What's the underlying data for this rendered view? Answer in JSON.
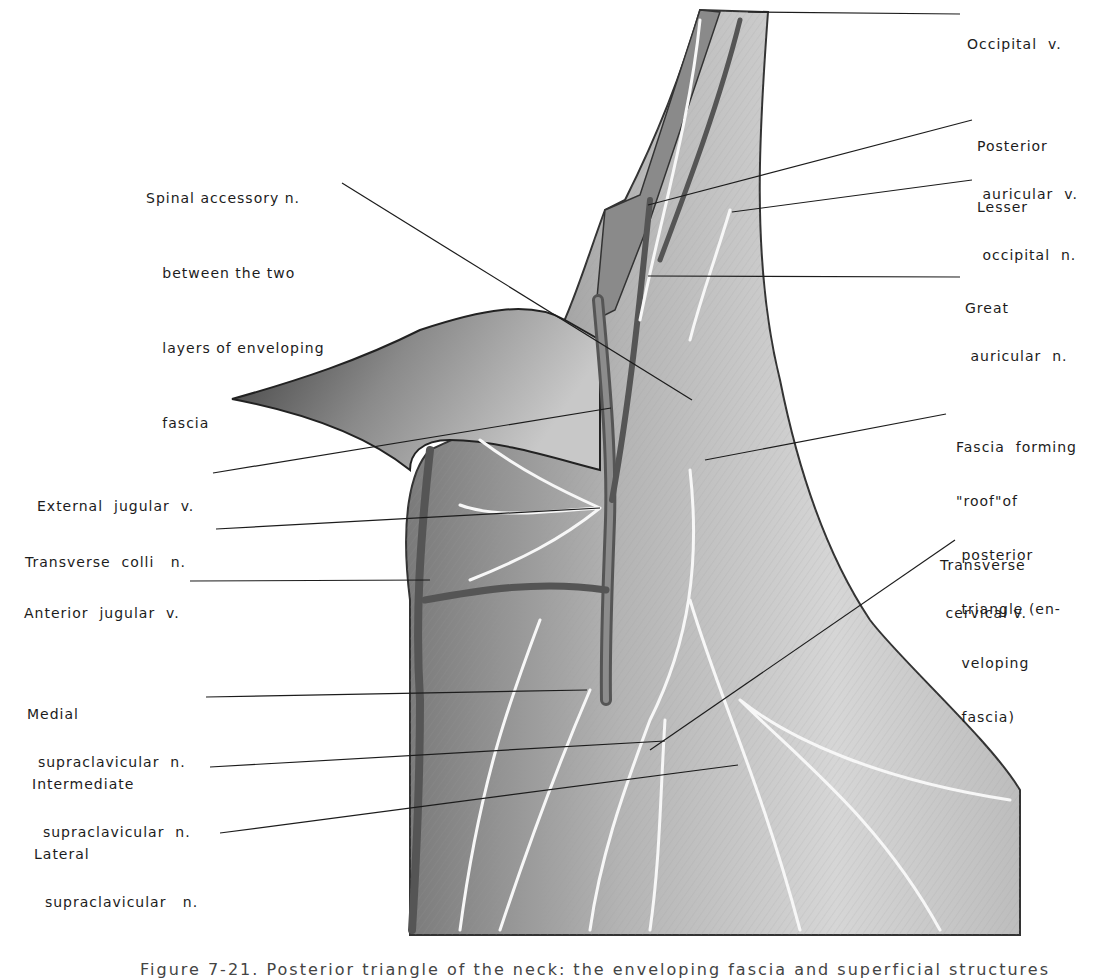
{
  "figure": {
    "caption": "Figure 7-21. Posterior triangle of the neck: the enveloping fascia and superficial structures",
    "labels": {
      "occipital_v": [
        "Occipital  v."
      ],
      "posterior_auricular_v": [
        "Posterior",
        " auricular  v."
      ],
      "lesser_occipital_n": [
        "Lesser",
        " occipital  n."
      ],
      "great_auricular_n": [
        "Great",
        " auricular  n."
      ],
      "spinal_accessory_n": [
        "Spinal accessory n.",
        "   between the two",
        "   layers of enveloping",
        "   fascia"
      ],
      "fascia_roof": [
        "Fascia  forming",
        "\"roof\"of",
        " posterior",
        " triangle (en-",
        " veloping",
        " fascia)"
      ],
      "transverse_cervical_v": [
        "Transverse",
        " cervical v."
      ],
      "external_jugular_v": [
        "External  jugular  v."
      ],
      "transverse_colli_n": [
        "Transverse  colli   n."
      ],
      "anterior_jugular_v": [
        "Anterior  jugular  v."
      ],
      "medial_supraclavicular_n": [
        "Medial",
        "  supraclavicular  n."
      ],
      "intermediate_supraclavicular_n": [
        "Intermediate",
        "  supraclavicular  n."
      ],
      "lateral_supraclavicular_n": [
        "Lateral",
        "  supraclavicular   n."
      ]
    }
  },
  "colors": {
    "ink": "#1c1c1c",
    "skin_dark": "#6e6e6e",
    "skin_mid": "#a8a8a8",
    "skin_light": "#dcdcdc",
    "vessel": "#5a5a5a",
    "nerve": "#f4f4f4"
  }
}
